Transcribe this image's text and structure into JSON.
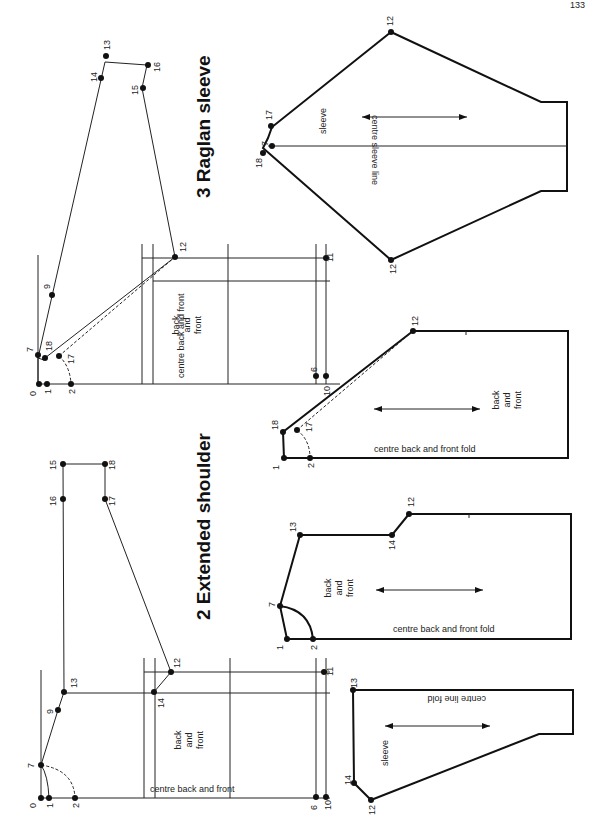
{
  "page": {
    "number": "133"
  },
  "sections": {
    "raglan": {
      "title": "3 Raglan sleeve",
      "draft": {
        "points": [
          "0",
          "1",
          "2",
          "7",
          "9",
          "12",
          "13",
          "14",
          "15",
          "16",
          "17",
          "18",
          "6",
          "10",
          "11"
        ],
        "labels": {
          "body": [
            "back",
            "and",
            "front"
          ],
          "centre": "centre back and front"
        }
      },
      "bodice": {
        "points": [
          "1",
          "2",
          "17",
          "18",
          "12"
        ],
        "labels": {
          "body": [
            "back",
            "and",
            "front"
          ],
          "fold": "centre back and front fold"
        }
      },
      "sleeve": {
        "points": [
          "7",
          "17",
          "18",
          "12",
          "12"
        ],
        "labels": {
          "name": "sleeve",
          "centre": "centre sleeve line"
        }
      }
    },
    "extended": {
      "title": "2 Extended shoulder",
      "draft": {
        "points": [
          "0",
          "1",
          "2",
          "7",
          "9",
          "13",
          "14",
          "12",
          "15",
          "16",
          "17",
          "18",
          "6",
          "10",
          "11"
        ],
        "labels": {
          "body": [
            "back",
            "and",
            "front"
          ],
          "centre": "centre back and front"
        }
      },
      "bodice": {
        "points": [
          "1",
          "2",
          "7",
          "13",
          "14",
          "12"
        ],
        "labels": {
          "body": [
            "back",
            "and",
            "front"
          ],
          "fold": "centre back and front fold"
        }
      },
      "sleeve": {
        "points": [
          "13",
          "14",
          "12"
        ],
        "labels": {
          "name": "sleeve",
          "fold": "centre line fold"
        }
      }
    }
  }
}
